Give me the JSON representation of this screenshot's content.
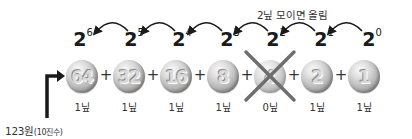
{
  "caption": "2닢 모이면 올림",
  "exponents": [
    {
      "base": "2",
      "power": "6"
    },
    {
      "base": "2",
      "power": "5"
    },
    {
      "base": "2",
      "power": "4"
    },
    {
      "base": "2",
      "power": "3"
    },
    {
      "base": "2",
      "power": "2"
    },
    {
      "base": "2",
      "power": "1"
    },
    {
      "base": "2",
      "power": "0"
    }
  ],
  "coins": [
    {
      "value": "64",
      "count_label": "1닢",
      "crossed": false
    },
    {
      "value": "32",
      "count_label": "1닢",
      "crossed": false
    },
    {
      "value": "16",
      "count_label": "1닢",
      "crossed": false
    },
    {
      "value": "8",
      "count_label": "1닢",
      "crossed": false
    },
    {
      "value": "4",
      "count_label": "0닢",
      "crossed": true
    },
    {
      "value": "2",
      "count_label": "1닢",
      "crossed": false
    },
    {
      "value": "1",
      "count_label": "1닢",
      "crossed": false
    }
  ],
  "operator": "+",
  "input": {
    "amount": "123원",
    "note": "(10진수)"
  },
  "colors": {
    "arrow": "#1a1a1a",
    "cross": "#6e6e6e",
    "coin_light": "#f5f5f5",
    "coin_dark": "#7d7d7d"
  }
}
